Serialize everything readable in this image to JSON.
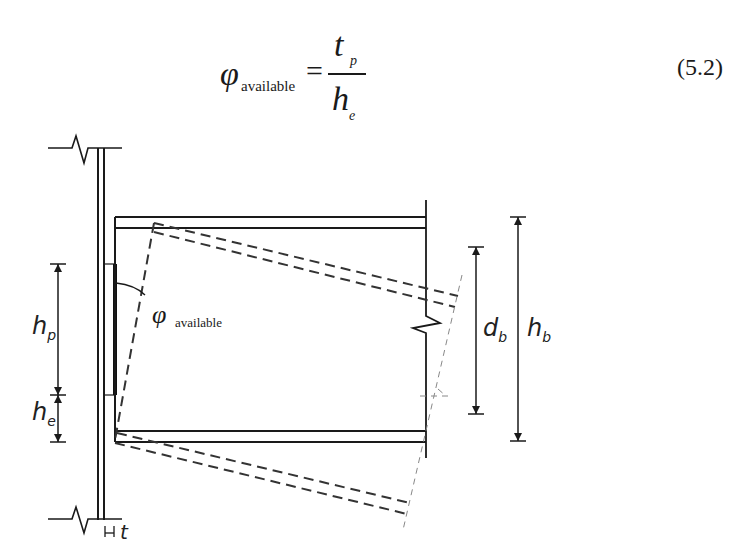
{
  "equation": {
    "lhs_symbol": "φ",
    "lhs_subscript": "available",
    "operator": "=",
    "numerator_symbol": "t",
    "numerator_subscript": "p",
    "denominator_symbol": "h",
    "denominator_subscript": "e",
    "number": "(5.2)"
  },
  "diagram": {
    "labels": {
      "hp": {
        "symbol": "h",
        "subscript": "p"
      },
      "he": {
        "symbol": "h",
        "subscript": "e"
      },
      "db": {
        "symbol": "d",
        "subscript": "b"
      },
      "hb": {
        "symbol": "h",
        "subscript": "b"
      },
      "phi": {
        "symbol": "φ",
        "subscript": "available"
      },
      "t": {
        "symbol": "t"
      }
    },
    "colors": {
      "line": "#1a1a1a",
      "dashed": "#333333",
      "thin_dashed": "#888888"
    }
  }
}
